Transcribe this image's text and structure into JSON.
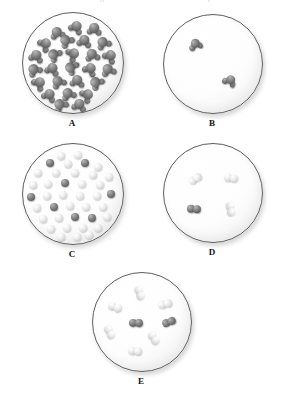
{
  "figure": {
    "kind": "molecular-level-diagram-set",
    "background_color": "#ffffff",
    "flask_outline_color": "#5e5e5e",
    "dark_atom_color": "#7c7c7c",
    "light_atom_color": "#e4e4e4",
    "label_color": "#111111",
    "cropped_top_text_left": "g",
    "cropped_top_text_right": "p"
  },
  "panels": [
    {
      "id": "A",
      "label": "A",
      "x": 22,
      "y": 12,
      "size": 100,
      "particle_count": 26,
      "particle_type": "cluster",
      "description": "densely packed dark gray polyatomic clusters filling the flask",
      "molecules": [
        {
          "cx": 34,
          "cy": 20,
          "color": "dark",
          "rot": -12
        },
        {
          "cx": 53,
          "cy": 14,
          "color": "dark",
          "rot": 30
        },
        {
          "cx": 71,
          "cy": 16,
          "color": "dark",
          "rot": 8
        },
        {
          "cx": 22,
          "cy": 31,
          "color": "dark",
          "rot": 52
        },
        {
          "cx": 43,
          "cy": 28,
          "color": "dark",
          "rot": -38
        },
        {
          "cx": 61,
          "cy": 28,
          "color": "dark",
          "rot": 14
        },
        {
          "cx": 80,
          "cy": 30,
          "color": "dark",
          "rot": -24
        },
        {
          "cx": 13,
          "cy": 43,
          "color": "dark",
          "rot": 18
        },
        {
          "cx": 31,
          "cy": 42,
          "color": "dark",
          "rot": -50
        },
        {
          "cx": 50,
          "cy": 41,
          "color": "dark",
          "rot": 62
        },
        {
          "cx": 69,
          "cy": 42,
          "color": "dark",
          "rot": -8
        },
        {
          "cx": 87,
          "cy": 43,
          "color": "dark",
          "rot": 40
        },
        {
          "cx": 11,
          "cy": 57,
          "color": "dark",
          "rot": -30
        },
        {
          "cx": 29,
          "cy": 56,
          "color": "dark",
          "rot": 22
        },
        {
          "cx": 48,
          "cy": 55,
          "color": "dark",
          "rot": -60
        },
        {
          "cx": 67,
          "cy": 56,
          "color": "dark",
          "rot": 34
        },
        {
          "cx": 85,
          "cy": 57,
          "color": "dark",
          "rot": -16
        },
        {
          "cx": 16,
          "cy": 70,
          "color": "dark",
          "rot": 46
        },
        {
          "cx": 35,
          "cy": 69,
          "color": "dark",
          "rot": -26
        },
        {
          "cx": 54,
          "cy": 68,
          "color": "dark",
          "rot": 10
        },
        {
          "cx": 73,
          "cy": 70,
          "color": "dark",
          "rot": -44
        },
        {
          "cx": 26,
          "cy": 82,
          "color": "dark",
          "rot": 28
        },
        {
          "cx": 45,
          "cy": 81,
          "color": "dark",
          "rot": -20
        },
        {
          "cx": 64,
          "cy": 82,
          "color": "dark",
          "rot": 56
        },
        {
          "cx": 37,
          "cy": 92,
          "color": "dark",
          "rot": -34
        },
        {
          "cx": 56,
          "cy": 92,
          "color": "dark",
          "rot": 16
        }
      ]
    },
    {
      "id": "B",
      "label": "B",
      "x": 163,
      "y": 14,
      "size": 98,
      "particle_count": 2,
      "particle_type": "cluster",
      "description": "only two dark gray polyatomic clusters, very sparse",
      "molecules": [
        {
          "cx": 32,
          "cy": 30,
          "color": "dark",
          "rot": -18
        },
        {
          "cx": 67,
          "cy": 66,
          "color": "dark",
          "rot": 26
        }
      ]
    },
    {
      "id": "C",
      "label": "C",
      "x": 22,
      "y": 143,
      "size": 100,
      "particle_count": 39,
      "particle_type": "single-atom",
      "dark_count": 9,
      "light_count": 30,
      "description": "dense mixture of individual dark gray and white spheres",
      "molecules": [
        {
          "cx": 38,
          "cy": 12,
          "color": "light",
          "rot": 0
        },
        {
          "cx": 55,
          "cy": 11,
          "color": "light",
          "rot": 0
        },
        {
          "cx": 27,
          "cy": 19,
          "color": "dark",
          "rot": 0
        },
        {
          "cx": 45,
          "cy": 20,
          "color": "light",
          "rot": 0
        },
        {
          "cx": 62,
          "cy": 19,
          "color": "dark",
          "rot": 0
        },
        {
          "cx": 75,
          "cy": 23,
          "color": "light",
          "rot": 0
        },
        {
          "cx": 15,
          "cy": 29,
          "color": "light",
          "rot": 0
        },
        {
          "cx": 33,
          "cy": 29,
          "color": "light",
          "rot": 0
        },
        {
          "cx": 52,
          "cy": 29,
          "color": "light",
          "rot": 0
        },
        {
          "cx": 70,
          "cy": 31,
          "color": "light",
          "rot": 0
        },
        {
          "cx": 86,
          "cy": 33,
          "color": "light",
          "rot": 0
        },
        {
          "cx": 10,
          "cy": 41,
          "color": "light",
          "rot": 0
        },
        {
          "cx": 25,
          "cy": 40,
          "color": "light",
          "rot": 0
        },
        {
          "cx": 42,
          "cy": 39,
          "color": "dark",
          "rot": 0
        },
        {
          "cx": 59,
          "cy": 40,
          "color": "light",
          "rot": 0
        },
        {
          "cx": 77,
          "cy": 41,
          "color": "light",
          "rot": 0
        },
        {
          "cx": 8,
          "cy": 53,
          "color": "dark",
          "rot": 0
        },
        {
          "cx": 24,
          "cy": 52,
          "color": "light",
          "rot": 0
        },
        {
          "cx": 40,
          "cy": 51,
          "color": "light",
          "rot": 0
        },
        {
          "cx": 57,
          "cy": 52,
          "color": "light",
          "rot": 0
        },
        {
          "cx": 74,
          "cy": 52,
          "color": "light",
          "rot": 0
        },
        {
          "cx": 88,
          "cy": 50,
          "color": "dark",
          "rot": 0
        },
        {
          "cx": 14,
          "cy": 64,
          "color": "light",
          "rot": 0
        },
        {
          "cx": 31,
          "cy": 63,
          "color": "dark",
          "rot": 0
        },
        {
          "cx": 47,
          "cy": 62,
          "color": "light",
          "rot": 0
        },
        {
          "cx": 63,
          "cy": 63,
          "color": "light",
          "rot": 0
        },
        {
          "cx": 80,
          "cy": 63,
          "color": "light",
          "rot": 0
        },
        {
          "cx": 20,
          "cy": 75,
          "color": "light",
          "rot": 0
        },
        {
          "cx": 36,
          "cy": 74,
          "color": "light",
          "rot": 0
        },
        {
          "cx": 52,
          "cy": 73,
          "color": "dark",
          "rot": 0
        },
        {
          "cx": 69,
          "cy": 74,
          "color": "dark",
          "rot": 0
        },
        {
          "cx": 84,
          "cy": 73,
          "color": "light",
          "rot": 0
        },
        {
          "cx": 28,
          "cy": 85,
          "color": "light",
          "rot": 0
        },
        {
          "cx": 44,
          "cy": 84,
          "color": "light",
          "rot": 0
        },
        {
          "cx": 60,
          "cy": 84,
          "color": "light",
          "rot": 0
        },
        {
          "cx": 75,
          "cy": 84,
          "color": "light",
          "rot": 0
        },
        {
          "cx": 38,
          "cy": 93,
          "color": "light",
          "rot": 0
        },
        {
          "cx": 54,
          "cy": 93,
          "color": "light",
          "rot": 0
        },
        {
          "cx": 66,
          "cy": 91,
          "color": "light",
          "rot": 0
        }
      ]
    },
    {
      "id": "D",
      "label": "D",
      "x": 163,
      "y": 143,
      "size": 98,
      "particle_count": 4,
      "particle_type": "diatomic",
      "dark_count": 1,
      "light_count": 3,
      "description": "four widely separated diatomic molecules: one dark pair, three light pairs",
      "molecules": [
        {
          "cx": 32,
          "cy": 36,
          "color": "light",
          "rot": -32
        },
        {
          "cx": 68,
          "cy": 35,
          "color": "light",
          "rot": 8
        },
        {
          "cx": 31,
          "cy": 66,
          "color": "dark",
          "rot": 4
        },
        {
          "cx": 68,
          "cy": 66,
          "color": "light",
          "rot": 78
        }
      ]
    },
    {
      "id": "E",
      "label": "E",
      "x": 92,
      "y": 272,
      "size": 98,
      "particle_count": 8,
      "particle_type": "diatomic",
      "dark_count": 2,
      "light_count": 6,
      "description": "eight diatomic molecules: two dark pairs and six light pairs, moderately spaced",
      "molecules": [
        {
          "cx": 48,
          "cy": 20,
          "color": "light",
          "rot": 72
        },
        {
          "cx": 22,
          "cy": 35,
          "color": "light",
          "rot": 20
        },
        {
          "cx": 73,
          "cy": 32,
          "color": "light",
          "rot": -12
        },
        {
          "cx": 44,
          "cy": 51,
          "color": "dark",
          "rot": 2
        },
        {
          "cx": 78,
          "cy": 50,
          "color": "dark",
          "rot": -20
        },
        {
          "cx": 17,
          "cy": 60,
          "color": "light",
          "rot": 64
        },
        {
          "cx": 62,
          "cy": 66,
          "color": "light",
          "rot": 56
        },
        {
          "cx": 43,
          "cy": 80,
          "color": "light",
          "rot": 6
        }
      ]
    }
  ]
}
